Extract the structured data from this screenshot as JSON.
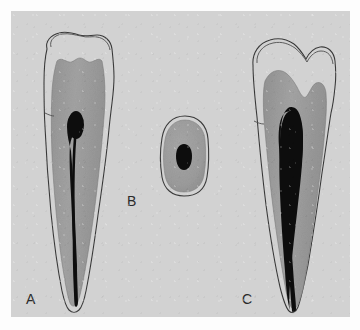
{
  "figure": {
    "kind": "anatomical-photograph-plate",
    "panel_background_color": "#d2d2d2",
    "page_background_color": "#fdfdfd"
  },
  "labels": {
    "a": "A",
    "b": "B",
    "c": "C"
  },
  "specimens": [
    {
      "id": "a",
      "label": "A",
      "view": "longitudinal-section",
      "description": "Tooth with narrow tapering root canal",
      "structures": [
        "enamel",
        "dentin",
        "pulp-canal"
      ]
    },
    {
      "id": "b",
      "label": "B",
      "view": "cross-section",
      "description": "Oval root cross-section with single oval canal",
      "structures": [
        "dentin",
        "pulp-canal"
      ]
    },
    {
      "id": "c",
      "label": "C",
      "view": "longitudinal-section",
      "description": "Tooth with wide tapering root canal",
      "structures": [
        "enamel",
        "dentin",
        "pulp-canal"
      ]
    }
  ],
  "colors": {
    "panel": "#d2d2d2",
    "enamel": "#c3c3c3",
    "dentin": "#9c9c9c",
    "pulp_canal": "#0d0d0d",
    "outline": "#3a3a3a",
    "label_text": "#2a2a2a"
  }
}
